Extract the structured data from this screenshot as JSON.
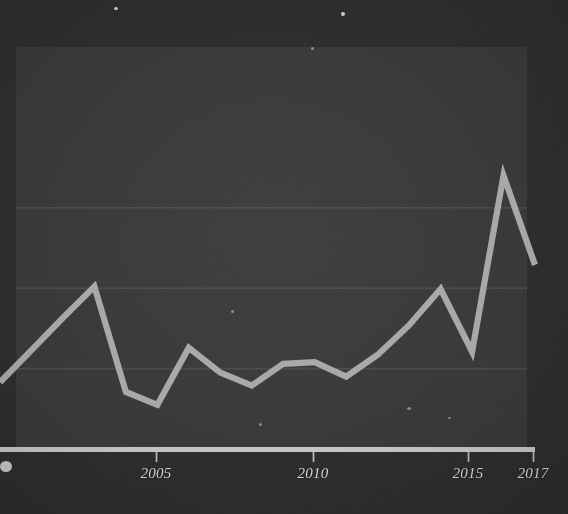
{
  "figure": {
    "background_color": "#2e2e2e",
    "plot_background_color": "#3a3a3a",
    "line_color": "#a9a9a9",
    "grid_color": "#4a4a4a",
    "axis_color": "#c8c8c8",
    "tick_label_color": "#d8d8d8"
  },
  "chart_data": {
    "type": "line",
    "title": "",
    "subtitle": "",
    "xlabel": "",
    "ylabel": "",
    "grid": true,
    "legend": false,
    "legend_position": "none",
    "xlim": [
      2000,
      2017
    ],
    "ylim": [
      0,
      5
    ],
    "xticks": [
      2005,
      2010,
      2015,
      2017
    ],
    "xtick_labels": [
      "2005",
      "2010",
      "2015",
      "2017"
    ],
    "yticks": [],
    "ytick_labels": [],
    "gridlines_y": [
      1,
      2,
      3
    ],
    "x": [
      2000,
      2001,
      2002,
      2003,
      2004,
      2005,
      2006,
      2007,
      2008,
      2009,
      2010,
      2011,
      2012,
      2013,
      2014,
      2015,
      2016,
      2017
    ],
    "series": [
      {
        "name": "value",
        "values": [
          0.83,
          1.23,
          1.63,
          2.02,
          0.71,
          0.55,
          1.26,
          0.95,
          0.79,
          1.06,
          1.08,
          0.9,
          1.17,
          1.54,
          1.99,
          1.21,
          3.4,
          2.29
        ]
      }
    ],
    "annotations": []
  },
  "axis": {
    "ticks": [
      {
        "label": "2005",
        "x_px": 156
      },
      {
        "label": "2010",
        "x_px": 313
      },
      {
        "label": "2015",
        "x_px": 468
      },
      {
        "label": "2017",
        "x_px": 533
      }
    ]
  }
}
